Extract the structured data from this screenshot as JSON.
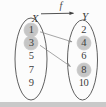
{
  "figure": {
    "type": "function-mapping-diagram",
    "function_label": "f",
    "domain_label": "X",
    "codomain_label": "Y",
    "domain_elements": [
      "1",
      "3",
      "5",
      "7",
      "9"
    ],
    "codomain_elements": [
      "2",
      "4",
      "6",
      "8",
      "10"
    ],
    "highlighted_domain": [
      "1",
      "3"
    ],
    "highlighted_codomain": [
      "4",
      "8"
    ],
    "mappings": [
      {
        "from": "1",
        "to": "4"
      },
      {
        "from": "3",
        "to": "8"
      }
    ]
  },
  "colors": {
    "background": "#fcfcfc",
    "ellipse_stroke": "#4e4e4e",
    "mapping_arrow": "#8f8f8f",
    "function_arrow": "#3f3f3f",
    "highlight": "#c6c6c6",
    "text": "#3d3d3d",
    "bottom_strip": "#c9c9c9"
  }
}
